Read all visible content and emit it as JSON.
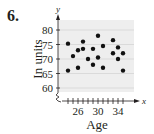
{
  "problem_number": "6.",
  "chart_data": {
    "type": "scatter",
    "title": "",
    "xlabel": "Age",
    "ylabel": "In units",
    "x_axis_letter": "x",
    "y_axis_letter": "y",
    "xlim": [
      23,
      36
    ],
    "ylim": [
      58,
      83
    ],
    "xticks": [
      26,
      30,
      34
    ],
    "yticks": [
      60,
      65,
      70,
      75,
      80
    ],
    "grid": "horizontal",
    "axis_break": "both",
    "points": [
      {
        "x": 24,
        "y": 75.3
      },
      {
        "x": 24,
        "y": 66
      },
      {
        "x": 25,
        "y": 71
      },
      {
        "x": 26,
        "y": 73
      },
      {
        "x": 26,
        "y": 67
      },
      {
        "x": 27,
        "y": 76
      },
      {
        "x": 27,
        "y": 73.5
      },
      {
        "x": 28,
        "y": 70
      },
      {
        "x": 29,
        "y": 73.5
      },
      {
        "x": 29,
        "y": 68
      },
      {
        "x": 30,
        "y": 78
      },
      {
        "x": 30,
        "y": 70.5
      },
      {
        "x": 31,
        "y": 74.5
      },
      {
        "x": 31,
        "y": 67
      },
      {
        "x": 33,
        "y": 76.5
      },
      {
        "x": 33,
        "y": 72
      },
      {
        "x": 34,
        "y": 74
      },
      {
        "x": 34,
        "y": 70
      },
      {
        "x": 35,
        "y": 72
      },
      {
        "x": 35,
        "y": 66
      }
    ],
    "colors": {
      "background_panel": "#eeeeee",
      "grid": "#ffffff",
      "point": "#111111",
      "axis": "#231f20"
    }
  }
}
